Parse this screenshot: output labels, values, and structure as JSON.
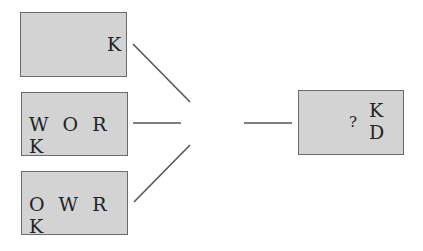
{
  "boxes": [
    {
      "id": "top",
      "label": "K"
    },
    {
      "id": "middle",
      "label": "W O R K"
    },
    {
      "id": "bottom",
      "label": "O W R K"
    }
  ],
  "result_box": {
    "question": "?",
    "line1": "K",
    "line2": "D"
  },
  "colors": {
    "box_fill": "#d3d3d3",
    "box_border": "#6a6a6a",
    "line": "#555555"
  }
}
